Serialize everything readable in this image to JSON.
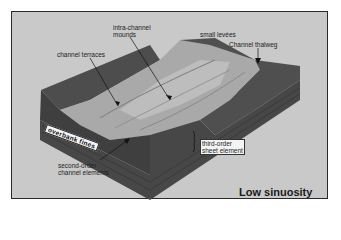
{
  "figure": {
    "title": "Low sinuosity",
    "labels": {
      "intra_channel_mounds": [
        "intra-channel",
        "mounds"
      ],
      "small_levees": "small levées",
      "channel_thalweg": "Channel thalweg",
      "channel_terraces": "channel terraces",
      "overbank_fines": "overbank fines",
      "second_order": [
        "second-order",
        "channel elements"
      ],
      "third_order": [
        "third-order",
        "sheet element"
      ]
    },
    "colors": {
      "background": "#c9c9c9",
      "block_dark": "#4a4a4a",
      "block_side": "#555555",
      "channel_surface": "#a8a8a8",
      "channel_highlight": "#c4c4c4"
    }
  }
}
